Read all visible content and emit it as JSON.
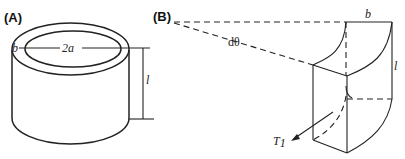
{
  "panels": [
    {
      "id": "A",
      "label": "(A)",
      "description": "Hollow cylindrical tube",
      "annotations": {
        "wall_thickness": "b",
        "diameter": "2a",
        "length": "l"
      }
    },
    {
      "id": "B",
      "label": "(B)",
      "description": "Wedge element of tube wall subtending angle dθ",
      "annotations": {
        "angle": "dθ",
        "thickness": "b",
        "length": "l",
        "tension_label": "T",
        "tension_subscript": "1"
      }
    }
  ],
  "colors": {
    "stroke": "#222222",
    "background": "#ffffff"
  }
}
